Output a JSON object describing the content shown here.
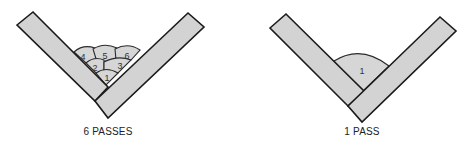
{
  "diagrams": [
    {
      "id": "multi-pass",
      "caption": "6 PASSES",
      "passes": [
        {
          "label": "1"
        },
        {
          "label": "2"
        },
        {
          "label": "3"
        },
        {
          "label": "4"
        },
        {
          "label": "5"
        },
        {
          "label": "6"
        }
      ]
    },
    {
      "id": "single-pass",
      "caption": "1 PASS",
      "passes": [
        {
          "label": "1"
        }
      ]
    }
  ],
  "colors": {
    "plate_fill": "#d3d3d3",
    "outline": "#1a1a1a",
    "background": "#ffffff"
  }
}
